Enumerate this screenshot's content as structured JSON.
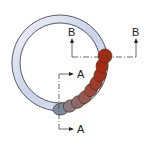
{
  "diagram": {
    "section_labels": {
      "b_left": "B",
      "b_right": "B",
      "a_top": "A",
      "a_bottom": "A"
    },
    "colors": {
      "ring_fill_light": "#e8ecf6",
      "ring_fill_dark": "#9eaed0",
      "ring_stroke": "#333333",
      "bead_start": "#7a8a9e",
      "bead_end": "#a52a14",
      "line": "#444444"
    }
  }
}
